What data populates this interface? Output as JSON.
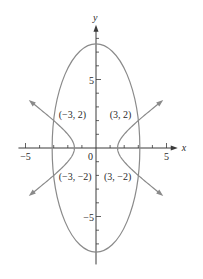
{
  "chart_data": {
    "type": "line",
    "title": "",
    "xlabel": "x",
    "ylabel": "y",
    "xlim": [
      -5.5,
      5.8
    ],
    "ylim": [
      -8.5,
      9
    ],
    "grid": false,
    "legend": null,
    "x_ticks": [
      -5,
      -4,
      -3,
      -2,
      -1,
      1,
      2,
      3,
      4,
      5
    ],
    "x_tick_labels": [
      {
        "value": -5,
        "label": "−5"
      },
      {
        "value": 0,
        "label": "0"
      },
      {
        "value": 5,
        "label": "5"
      }
    ],
    "y_ticks": [
      -7,
      -6,
      -5,
      -4,
      -3,
      -2,
      -1,
      1,
      2,
      3,
      4,
      5,
      6,
      7,
      8
    ],
    "y_tick_labels": [
      {
        "value": 5,
        "label": "5"
      },
      {
        "value": -5,
        "label": "−5"
      }
    ],
    "series": [
      {
        "name": "ellipse",
        "kind": "ellipse",
        "center": [
          0,
          0
        ],
        "semi_axis_x": 3.11,
        "semi_axis_y": 7.6,
        "color": "#8a8a8a"
      },
      {
        "name": "hyperbola",
        "kind": "hyperbola_horizontal",
        "vertex_x": 1.53,
        "passes_through": [
          3,
          2
        ],
        "x_extent": 4.6,
        "arrows": true,
        "color": "#8a8a8a"
      }
    ],
    "annotations": [
      {
        "point": [
          -3,
          2
        ],
        "label": "(−3, 2)"
      },
      {
        "point": [
          3,
          2
        ],
        "label": "(3, 2)"
      },
      {
        "point": [
          -3,
          -2
        ],
        "label": "(−3, −2)"
      },
      {
        "point": [
          3,
          -2
        ],
        "label": "(3, −2)"
      }
    ]
  },
  "layout": {
    "origin_px": [
      96,
      148
    ],
    "scale_x_px": 14.1,
    "scale_y_px": 13.7
  }
}
